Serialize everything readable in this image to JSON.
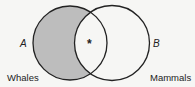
{
  "diagram": {
    "type": "venn",
    "sets": [
      {
        "id": "A",
        "letter": "A",
        "name": "Whales",
        "shaded_exclusive_region": true
      },
      {
        "id": "B",
        "letter": "B",
        "name": "Mammals",
        "shaded_exclusive_region": false
      }
    ],
    "intersection_marker": "*",
    "colors": {
      "background": "#f6f6f4",
      "outline": "#222222",
      "shade": "#bdbdbd"
    }
  }
}
